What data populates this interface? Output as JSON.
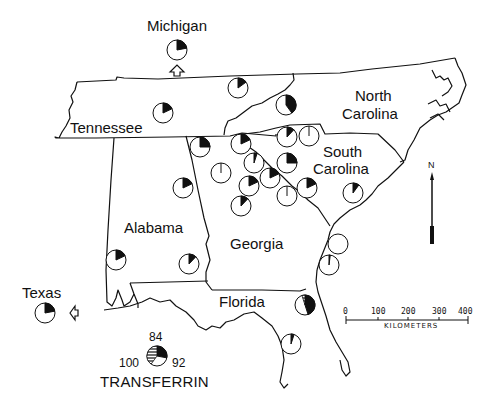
{
  "labels": {
    "michigan": "Michigan",
    "tennessee": "Tennessee",
    "north_carolina_1": "North",
    "north_carolina_2": "Carolina",
    "south_carolina_1": "South",
    "south_carolina_2": "Carolina",
    "alabama": "Alabama",
    "georgia": "Georgia",
    "florida": "Florida",
    "texas": "Texas"
  },
  "legend": {
    "title": "TRANSFERRIN",
    "allele_top": "84",
    "allele_left": "100",
    "allele_right": "92"
  },
  "scale": {
    "ticks": [
      "0",
      "100",
      "200",
      "300",
      "400"
    ],
    "unit": "KILOMETERS"
  },
  "north_arrow": {
    "label": "N"
  },
  "colors": {
    "ink": "#111111",
    "paper": "#ffffff"
  },
  "chart_data": {
    "type": "pie-map",
    "title": "TRANSFERRIN",
    "legend": [
      {
        "allele": "100",
        "fill": "white"
      },
      {
        "allele": "92",
        "fill": "black"
      },
      {
        "allele": "84",
        "fill": "hatched"
      }
    ],
    "pies": [
      {
        "location": "Michigan (inset)",
        "x": 177,
        "y": 50,
        "black_fraction": 0.22,
        "hatched_fraction": 0
      },
      {
        "location": "Texas (inset)",
        "x": 45,
        "y": 313,
        "black_fraction": 0.22,
        "hatched_fraction": 0
      },
      {
        "location": "Tennessee",
        "x": 163,
        "y": 113,
        "black_fraction": 0.18,
        "hatched_fraction": 0
      },
      {
        "location": "Tennessee NE",
        "x": 238,
        "y": 88,
        "black_fraction": 0.15,
        "hatched_fraction": 0
      },
      {
        "location": "Tennessee E",
        "x": 286,
        "y": 105,
        "black_fraction": 0.4,
        "hatched_fraction": 0
      },
      {
        "location": "N Georgia W",
        "x": 200,
        "y": 147,
        "black_fraction": 0.25,
        "hatched_fraction": 0
      },
      {
        "location": "N Georgia",
        "x": 241,
        "y": 144,
        "black_fraction": 0.18,
        "hatched_fraction": 0
      },
      {
        "location": "N Georgia 2",
        "x": 221,
        "y": 173,
        "black_fraction": 0.01,
        "hatched_fraction": 0
      },
      {
        "location": "NE Georgia 1",
        "x": 287,
        "y": 137,
        "black_fraction": 0.12,
        "hatched_fraction": 0
      },
      {
        "location": "NE Georgia 2",
        "x": 309,
        "y": 136,
        "black_fraction": 0.01,
        "hatched_fraction": 0
      },
      {
        "location": "Georgia C1",
        "x": 254,
        "y": 163,
        "black_fraction": 0.05,
        "hatched_fraction": 0
      },
      {
        "location": "Georgia C2",
        "x": 287,
        "y": 163,
        "black_fraction": 0.25,
        "hatched_fraction": 0
      },
      {
        "location": "Georgia C3",
        "x": 249,
        "y": 186,
        "black_fraction": 0.18,
        "hatched_fraction": 0
      },
      {
        "location": "Georgia C4",
        "x": 270,
        "y": 178,
        "black_fraction": 0.18,
        "hatched_fraction": 0
      },
      {
        "location": "Georgia C5",
        "x": 287,
        "y": 196,
        "black_fraction": 0.01,
        "hatched_fraction": 0
      },
      {
        "location": "South Carolina W",
        "x": 307,
        "y": 188,
        "black_fraction": 0.18,
        "hatched_fraction": 0
      },
      {
        "location": "Georgia S",
        "x": 241,
        "y": 206,
        "black_fraction": 0.12,
        "hatched_fraction": 0
      },
      {
        "location": "Alabama N",
        "x": 183,
        "y": 188,
        "black_fraction": 0.18,
        "hatched_fraction": 0
      },
      {
        "location": "South Carolina coast",
        "x": 353,
        "y": 193,
        "black_fraction": 0.1,
        "hatched_fraction": 0
      },
      {
        "location": "Alabama SW",
        "x": 116,
        "y": 260,
        "black_fraction": 0.18,
        "hatched_fraction": 0
      },
      {
        "location": "Alabama SE",
        "x": 189,
        "y": 264,
        "black_fraction": 0.12,
        "hatched_fraction": 0
      },
      {
        "location": "Georgia coast 1",
        "x": 338,
        "y": 244,
        "black_fraction": 0.0,
        "hatched_fraction": 0
      },
      {
        "location": "Georgia coast 2",
        "x": 329,
        "y": 265,
        "black_fraction": 0.02,
        "hatched_fraction": 0
      },
      {
        "location": "NE Florida",
        "x": 305,
        "y": 305,
        "black_fraction": 0.45,
        "hatched_fraction": 0.05
      },
      {
        "location": "Florida peninsula",
        "x": 291,
        "y": 344,
        "black_fraction": 0.05,
        "hatched_fraction": 0
      },
      {
        "location": "Legend",
        "x": 157,
        "y": 356,
        "black_fraction": 0.28,
        "hatched_fraction": 0.4
      }
    ]
  }
}
